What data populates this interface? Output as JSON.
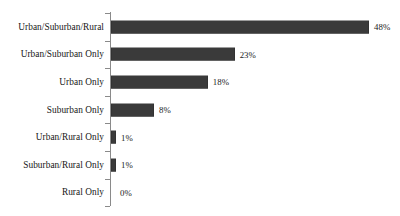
{
  "chart_data": {
    "type": "bar",
    "orientation": "horizontal",
    "title": "",
    "subtitle": "",
    "xlabel": "",
    "ylabel": "",
    "xlim": [
      0,
      48
    ],
    "grid": false,
    "legend": null,
    "axis_line_color": "#8a8a8a",
    "bar_color": "#3a3a3a",
    "text_color": "#151515",
    "categories": [
      "Urban/Suburban/Rural",
      "Urban/Suburban Only",
      "Urban Only",
      "Suburban Only",
      "Urban/Rural Only",
      "Suburban/Rural Only",
      "Rural Only"
    ],
    "values": [
      48,
      23,
      18,
      8,
      1,
      1,
      0
    ],
    "data_labels": [
      "48%",
      "23%",
      "18%",
      "8%",
      "1%",
      "1%",
      "0%"
    ],
    "bars": [
      {
        "label": "Urban/Suburban/Rural",
        "value": 48,
        "data_label": "48%"
      },
      {
        "label": "Urban/Suburban Only",
        "value": 23,
        "data_label": "23%"
      },
      {
        "label": "Urban Only",
        "value": 18,
        "data_label": "18%"
      },
      {
        "label": "Suburban Only",
        "value": 8,
        "data_label": "8%"
      },
      {
        "label": "Urban/Rural Only",
        "value": 1,
        "data_label": "1%"
      },
      {
        "label": "Suburban/Rural Only",
        "value": 1,
        "data_label": "1%"
      },
      {
        "label": "Rural Only",
        "value": 0,
        "data_label": "0%"
      }
    ]
  }
}
